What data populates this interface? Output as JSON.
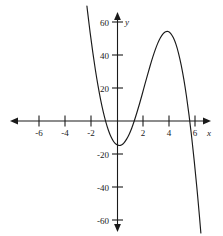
{
  "chart_data": {
    "type": "line",
    "title": "",
    "subtitle": "",
    "xlabel": "x",
    "ylabel": "y",
    "xlim": [
      -8,
      8
    ],
    "ylim": [
      -70,
      70
    ],
    "grid": false,
    "legend": null,
    "x_ticks": [
      -6,
      -4,
      -2,
      2,
      4,
      6
    ],
    "x_tick_labels": [
      "-6",
      "-4",
      "-2",
      "2",
      "4",
      "6"
    ],
    "y_ticks": [
      60,
      40,
      20,
      -20,
      -40,
      -60
    ],
    "y_tick_labels": [
      "60",
      "40",
      "20",
      "-20",
      "-40",
      "-60"
    ],
    "series": [
      {
        "name": "cubic",
        "description": "cubic polynomial with negative leading coefficient",
        "roots": [
          -1.5,
          1.6,
          5.5
        ],
        "local_minimum": {
          "x": 0.3,
          "y": -12
        },
        "local_maximum": {
          "x": 4.0,
          "y": 22
        },
        "y_intercept": -11,
        "x": [
          -2.5,
          -2.3,
          -2.1,
          -1.9,
          -1.7,
          -1.5,
          -1.3,
          -1.1,
          -0.9,
          -0.7,
          -0.5,
          -0.3,
          -0.1,
          0.1,
          0.3,
          0.5,
          0.7,
          0.9,
          1.1,
          1.3,
          1.5,
          1.7,
          1.9,
          2.1,
          2.3,
          2.5,
          2.7,
          2.9,
          3.1,
          3.3,
          3.5,
          3.7,
          3.9,
          4.1,
          4.3,
          4.5,
          4.7,
          4.9,
          5.1,
          5.3,
          5.5,
          5.7,
          5.9,
          6.1,
          6.3,
          6.5
        ],
        "y": [
          80.0,
          66.1,
          53.3,
          41.6,
          30.9,
          21.4,
          13.0,
          5.7,
          -0.5,
          -5.6,
          -9.6,
          -12.4,
          -14.1,
          -14.8,
          -14.5,
          -13.2,
          -11.0,
          -8.0,
          -4.2,
          0.3,
          5.3,
          10.6,
          16.2,
          22.0,
          27.7,
          33.2,
          38.4,
          43.1,
          47.2,
          50.5,
          52.8,
          54.1,
          54.2,
          53.0,
          50.4,
          46.4,
          40.9,
          33.9,
          25.4,
          15.3,
          3.7,
          -9.4,
          -24.0,
          -40.0,
          -57.4,
          -76.1
        ]
      }
    ],
    "axes": {
      "x_axis_arrows": [
        "left",
        "right"
      ],
      "y_axis_arrows": [
        "up",
        "down"
      ],
      "origin_label": ""
    },
    "colors": {
      "curve": "#1a1a1a",
      "axis": "#1a1a1a",
      "text": "#1a1a1a",
      "background": "#ffffff"
    }
  }
}
